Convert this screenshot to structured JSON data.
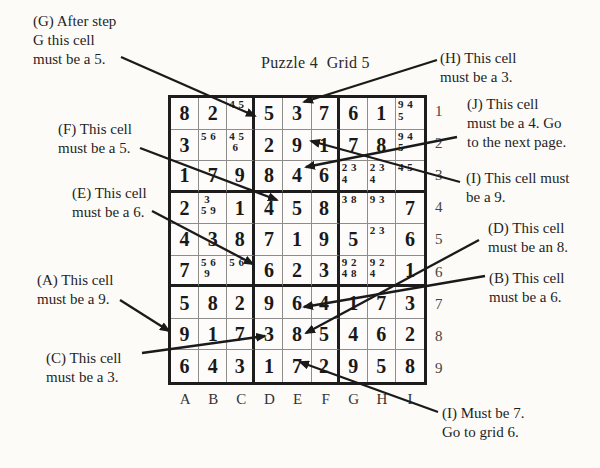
{
  "title": "Puzzle 4  Grid 5",
  "colors": {
    "paper": "#fcfbf8",
    "ink": "#1d1d1d"
  },
  "grid": {
    "column_labels": [
      "A",
      "B",
      "C",
      "D",
      "E",
      "F",
      "G",
      "H",
      "I"
    ],
    "row_labels": [
      "1",
      "2",
      "3",
      "4",
      "5",
      "6",
      "7",
      "8",
      "9"
    ],
    "cells": [
      [
        {
          "big": "8"
        },
        {
          "big": "2"
        },
        {
          "pencil": "4 5"
        },
        {
          "big": "5"
        },
        {
          "big": "3"
        },
        {
          "big": "7"
        },
        {
          "big": "6"
        },
        {
          "big": "1"
        },
        {
          "pencil": "9 4\n5"
        }
      ],
      [
        {
          "big": "3"
        },
        {
          "pencil": "5 6"
        },
        {
          "pencil": "4 5\n 6"
        },
        {
          "big": "2"
        },
        {
          "big": "9"
        },
        {
          "big": "1"
        },
        {
          "big": "7"
        },
        {
          "big": "8"
        },
        {
          "pencil": "9 4\n5"
        }
      ],
      [
        {
          "big": "1"
        },
        {
          "big": "7"
        },
        {
          "big": "9"
        },
        {
          "big": "8"
        },
        {
          "big": "4"
        },
        {
          "big": "6"
        },
        {
          "pencil": "2 3\n4"
        },
        {
          "pencil": "2 3\n4"
        },
        {
          "pencil": "4 5"
        }
      ],
      [
        {
          "big": "2"
        },
        {
          "pencil": " 3\n5 9"
        },
        {
          "big": "1"
        },
        {
          "big": "4"
        },
        {
          "big": "5"
        },
        {
          "big": "8"
        },
        {
          "pencil": "3 8"
        },
        {
          "pencil": "9 3"
        },
        {
          "big": "7"
        }
      ],
      [
        {
          "big": "4"
        },
        {
          "big": "3"
        },
        {
          "big": "8"
        },
        {
          "big": "7"
        },
        {
          "big": "1"
        },
        {
          "big": "9"
        },
        {
          "big": "5"
        },
        {
          "pencil": "2 3"
        },
        {
          "big": "6"
        }
      ],
      [
        {
          "big": "7"
        },
        {
          "pencil": "5 6\n 9"
        },
        {
          "pencil": "5 6"
        },
        {
          "big": "6"
        },
        {
          "big": "2"
        },
        {
          "big": "3"
        },
        {
          "pencil": "9 2\n4 8"
        },
        {
          "pencil": "9 2\n4"
        },
        {
          "big": "1"
        }
      ],
      [
        {
          "big": "5"
        },
        {
          "big": "8"
        },
        {
          "big": "2"
        },
        {
          "big": "9"
        },
        {
          "big": "6"
        },
        {
          "big": "4"
        },
        {
          "big": "1"
        },
        {
          "big": "7"
        },
        {
          "big": "3"
        }
      ],
      [
        {
          "big": "9"
        },
        {
          "big": "1"
        },
        {
          "big": "7"
        },
        {
          "big": "3"
        },
        {
          "big": "8"
        },
        {
          "big": "5"
        },
        {
          "big": "4"
        },
        {
          "big": "6"
        },
        {
          "big": "2"
        }
      ],
      [
        {
          "big": "6"
        },
        {
          "big": "4"
        },
        {
          "big": "3"
        },
        {
          "big": "1"
        },
        {
          "big": "7"
        },
        {
          "big": "2"
        },
        {
          "big": "9"
        },
        {
          "big": "5"
        },
        {
          "big": "8"
        }
      ]
    ]
  },
  "annotations": {
    "g": {
      "label": "G",
      "lines": [
        "(G) After step",
        "G this cell",
        "must be a 5."
      ]
    },
    "f": {
      "label": "F",
      "lines": [
        "(F) This cell",
        "must be a 5."
      ]
    },
    "e": {
      "label": "E",
      "lines": [
        "(E) This cell",
        "must be a 6."
      ]
    },
    "a": {
      "label": "A",
      "lines": [
        "(A) This cell",
        "must be a 9."
      ]
    },
    "c": {
      "label": "C",
      "lines": [
        "(C) This cell",
        "must be a 3."
      ]
    },
    "h": {
      "label": "H",
      "lines": [
        "(H) This cell",
        "must be a 3."
      ]
    },
    "j": {
      "label": "J",
      "lines": [
        "(J) This cell",
        "must be a 4. Go",
        "to the next page."
      ]
    },
    "i1": {
      "label": "I",
      "lines": [
        "(I) This cell must",
        "be a 9."
      ]
    },
    "d": {
      "label": "D",
      "lines": [
        "(D) This cell",
        "must be an 8."
      ]
    },
    "b": {
      "label": "B",
      "lines": [
        "(B) This cell",
        "must be a 6."
      ]
    },
    "i2": {
      "label": "I",
      "lines": [
        "(I) Must be 7.",
        "Go to grid 6."
      ]
    }
  }
}
